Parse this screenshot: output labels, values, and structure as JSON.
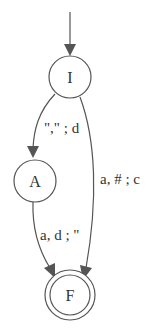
{
  "diagram": {
    "type": "finite-state-transducer",
    "colors": {
      "stroke": "#555555",
      "text": "#333333",
      "background": "#ffffff"
    },
    "nodes": [
      {
        "id": "I",
        "label": "I",
        "initial": true,
        "final": false
      },
      {
        "id": "A",
        "label": "A",
        "initial": false,
        "final": false
      },
      {
        "id": "F",
        "label": "F",
        "initial": false,
        "final": true
      }
    ],
    "edges": [
      {
        "from": "I",
        "to": "A",
        "label": "\",\" ; d"
      },
      {
        "from": "I",
        "to": "F",
        "label": "a, # ; c"
      },
      {
        "from": "A",
        "to": "F",
        "label": "a, d ; \""
      }
    ]
  }
}
